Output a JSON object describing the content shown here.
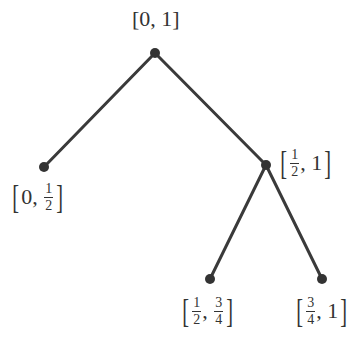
{
  "diagram": {
    "type": "binary-tree",
    "edge_color": "#3a3a3a",
    "node_color": "#333333",
    "nodes": [
      {
        "id": "root",
        "label": "[0, 1]",
        "x": 155,
        "y": 53
      },
      {
        "id": "left",
        "label": "[0, 1/2]",
        "x": 44,
        "y": 167
      },
      {
        "id": "right",
        "label": "[1/2, 1]",
        "x": 266,
        "y": 165
      },
      {
        "id": "right-left",
        "label": "[1/2, 3/4]",
        "x": 210,
        "y": 279
      },
      {
        "id": "right-right",
        "label": "[3/4, 1]",
        "x": 322,
        "y": 279
      }
    ],
    "edges": [
      {
        "from": "root",
        "to": "left"
      },
      {
        "from": "root",
        "to": "right"
      },
      {
        "from": "right",
        "to": "right-left"
      },
      {
        "from": "right",
        "to": "right-right"
      }
    ],
    "labels": {
      "root": {
        "text": "[0, 1]"
      },
      "left": {
        "open": "[",
        "a": "0",
        "sep": ",",
        "b_num": "1",
        "b_den": "2",
        "close": "]"
      },
      "right": {
        "open": "[",
        "a_num": "1",
        "a_den": "2",
        "sep": ",",
        "b": "1",
        "close": "]"
      },
      "right_left": {
        "open": "[",
        "a_num": "1",
        "a_den": "2",
        "sep": ",",
        "b_num": "3",
        "b_den": "4",
        "close": "]"
      },
      "right_right": {
        "open": "[",
        "a_num": "3",
        "a_den": "4",
        "sep": ",",
        "b": "1",
        "close": "]"
      }
    }
  }
}
